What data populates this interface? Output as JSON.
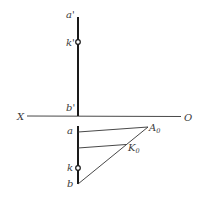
{
  "diagram": {
    "title": "",
    "axis": {
      "left_label": "X",
      "right_label": "O"
    },
    "labels": {
      "a_prime": "a'",
      "k_prime": "k'",
      "b_prime": "b'",
      "a": "a",
      "k": "k",
      "b": "b",
      "A0_main": "A",
      "A0_sub": "0",
      "K0_main": "K",
      "K0_sub": "0"
    },
    "colors": {
      "line": "#1a1a1a",
      "text": "#3a3a3a",
      "background": "#ffffff"
    }
  }
}
